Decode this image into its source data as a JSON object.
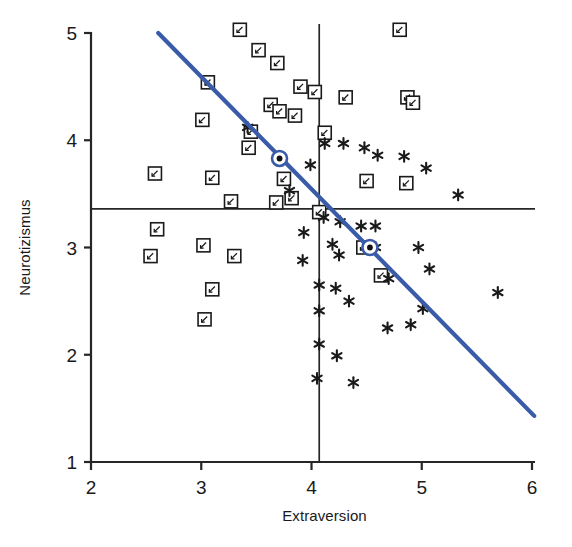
{
  "chart_data": {
    "type": "scatter",
    "title": "",
    "xlabel": "Extraversion",
    "ylabel": "Neurotizismus",
    "xlim": [
      2,
      6
    ],
    "ylim": [
      1,
      5
    ],
    "xticks": [
      2,
      3,
      4,
      5,
      6
    ],
    "yticks": [
      1,
      2,
      3,
      4,
      5
    ],
    "xtick_labels": [
      "2",
      "3",
      "4",
      "5",
      "6"
    ],
    "ytick_labels": [
      "1",
      "2",
      "3",
      "4",
      "5"
    ],
    "grid": false,
    "legend": "none",
    "reference_lines": {
      "vertical_x": 4.07,
      "horizontal_y": 3.36,
      "color": "#262626"
    },
    "regression_line": {
      "name": "Regressionsgerade",
      "color": "#3a5ba8",
      "x_start": 2.61,
      "y_start": 5.0,
      "x_end": 6.02,
      "y_end": 1.43
    },
    "highlighted_points": [
      {
        "x": 3.71,
        "y": 3.83
      },
      {
        "x": 4.53,
        "y": 3.0
      }
    ],
    "series": [
      {
        "name": "Quadrat",
        "marker": "square",
        "color": "#1a1a1a",
        "points": [
          {
            "x": 3.35,
            "y": 5.03
          },
          {
            "x": 3.52,
            "y": 4.84
          },
          {
            "x": 3.69,
            "y": 4.72
          },
          {
            "x": 4.8,
            "y": 5.03
          },
          {
            "x": 3.06,
            "y": 4.54
          },
          {
            "x": 3.9,
            "y": 4.5
          },
          {
            "x": 4.03,
            "y": 4.45
          },
          {
            "x": 4.31,
            "y": 4.4
          },
          {
            "x": 4.87,
            "y": 4.4
          },
          {
            "x": 4.92,
            "y": 4.35
          },
          {
            "x": 3.63,
            "y": 4.33
          },
          {
            "x": 3.71,
            "y": 4.27
          },
          {
            "x": 3.85,
            "y": 4.23
          },
          {
            "x": 3.01,
            "y": 4.19
          },
          {
            "x": 3.45,
            "y": 4.08
          },
          {
            "x": 4.12,
            "y": 4.07
          },
          {
            "x": 3.43,
            "y": 3.93
          },
          {
            "x": 2.58,
            "y": 3.69
          },
          {
            "x": 3.1,
            "y": 3.65
          },
          {
            "x": 3.75,
            "y": 3.64
          },
          {
            "x": 4.5,
            "y": 3.62
          },
          {
            "x": 4.86,
            "y": 3.6
          },
          {
            "x": 3.82,
            "y": 3.46
          },
          {
            "x": 3.27,
            "y": 3.43
          },
          {
            "x": 3.68,
            "y": 3.42
          },
          {
            "x": 4.07,
            "y": 3.33
          },
          {
            "x": 2.6,
            "y": 3.17
          },
          {
            "x": 3.02,
            "y": 3.02
          },
          {
            "x": 4.47,
            "y": 3.0
          },
          {
            "x": 2.54,
            "y": 2.92
          },
          {
            "x": 3.3,
            "y": 2.92
          },
          {
            "x": 4.63,
            "y": 2.74
          },
          {
            "x": 3.1,
            "y": 2.61
          },
          {
            "x": 3.03,
            "y": 2.33
          }
        ]
      },
      {
        "name": "Stern",
        "marker": "asterisk",
        "color": "#1a1a1a",
        "points": [
          {
            "x": 3.42,
            "y": 4.12
          },
          {
            "x": 4.12,
            "y": 3.97
          },
          {
            "x": 4.29,
            "y": 3.97
          },
          {
            "x": 4.48,
            "y": 3.93
          },
          {
            "x": 4.6,
            "y": 3.86
          },
          {
            "x": 4.84,
            "y": 3.85
          },
          {
            "x": 3.99,
            "y": 3.77
          },
          {
            "x": 5.04,
            "y": 3.74
          },
          {
            "x": 3.8,
            "y": 3.53
          },
          {
            "x": 5.33,
            "y": 3.49
          },
          {
            "x": 4.11,
            "y": 3.28
          },
          {
            "x": 4.26,
            "y": 3.24
          },
          {
            "x": 4.45,
            "y": 3.2
          },
          {
            "x": 4.58,
            "y": 3.2
          },
          {
            "x": 3.93,
            "y": 3.14
          },
          {
            "x": 4.19,
            "y": 3.03
          },
          {
            "x": 4.58,
            "y": 3.0
          },
          {
            "x": 4.97,
            "y": 3.0
          },
          {
            "x": 4.25,
            "y": 2.93
          },
          {
            "x": 3.92,
            "y": 2.88
          },
          {
            "x": 5.07,
            "y": 2.8
          },
          {
            "x": 4.7,
            "y": 2.71
          },
          {
            "x": 4.07,
            "y": 2.65
          },
          {
            "x": 4.22,
            "y": 2.62
          },
          {
            "x": 5.69,
            "y": 2.58
          },
          {
            "x": 4.34,
            "y": 2.5
          },
          {
            "x": 4.07,
            "y": 2.41
          },
          {
            "x": 5.01,
            "y": 2.43
          },
          {
            "x": 4.9,
            "y": 2.28
          },
          {
            "x": 4.69,
            "y": 2.25
          },
          {
            "x": 4.07,
            "y": 2.1
          },
          {
            "x": 4.23,
            "y": 1.99
          },
          {
            "x": 4.05,
            "y": 1.78
          },
          {
            "x": 4.38,
            "y": 1.74
          }
        ]
      }
    ]
  }
}
